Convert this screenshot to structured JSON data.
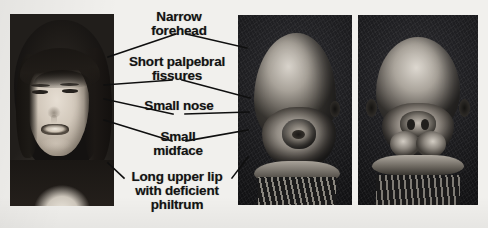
{
  "figure": {
    "background_color": "#f1f0ed",
    "ink_color": "#131313"
  },
  "labels": [
    {
      "id": "narrow-forehead",
      "lines": [
        "Narrow",
        "forehead"
      ]
    },
    {
      "id": "short-palpebral-fissures",
      "lines": [
        "Short palpebral",
        "fissures"
      ]
    },
    {
      "id": "small-nose",
      "lines": [
        "Small nose"
      ]
    },
    {
      "id": "small-midface",
      "lines": [
        "Small",
        "midface"
      ]
    },
    {
      "id": "long-upper-lip",
      "lines": [
        "Long upper lip",
        "with deficient",
        "philtrum"
      ]
    }
  ],
  "panels": [
    {
      "id": "clinical-photograph",
      "kind": "photograph",
      "caption": "Child's face showing characteristic facial features",
      "position": {
        "x": 10,
        "y": 14,
        "width": 104,
        "height": 192
      }
    },
    {
      "id": "sem-micrograph-oblique",
      "kind": "scanning-electron-micrograph",
      "caption": "Embryonic head, oblique view",
      "position": {
        "x": 238,
        "y": 15,
        "width": 114,
        "height": 190
      }
    },
    {
      "id": "sem-micrograph-frontal",
      "kind": "scanning-electron-micrograph",
      "caption": "Embryonic head, frontal view",
      "position": {
        "x": 358,
        "y": 15,
        "width": 120,
        "height": 190
      }
    }
  ],
  "leaders": {
    "stroke_color": "#0f0f0f",
    "stroke_width": 1.6,
    "segments": [
      {
        "label": "narrow-forehead",
        "from": "photo",
        "points": "108,57 176,34"
      },
      {
        "label": "narrow-forehead",
        "from": "sem",
        "points": "247,48 186,34"
      },
      {
        "label": "short-palpebral-fissures",
        "from": "photo",
        "points": "104,85 172,80"
      },
      {
        "label": "short-palpebral-fissures",
        "from": "sem",
        "points": "250,98 182,80"
      },
      {
        "label": "small-nose",
        "from": "photo",
        "points": "104,99 173,114"
      },
      {
        "label": "small-nose",
        "from": "sem",
        "points": "249,112 185,114"
      },
      {
        "label": "small-midface",
        "from": "photo",
        "points": "104,120 172,141"
      },
      {
        "label": "small-midface",
        "from": "sem",
        "points": "248,130 186,141"
      },
      {
        "label": "long-upper-lip",
        "from": "photo",
        "points": "108,163 124,178"
      },
      {
        "label": "long-upper-lip",
        "from": "sem",
        "points": "248,157 232,178"
      }
    ]
  }
}
